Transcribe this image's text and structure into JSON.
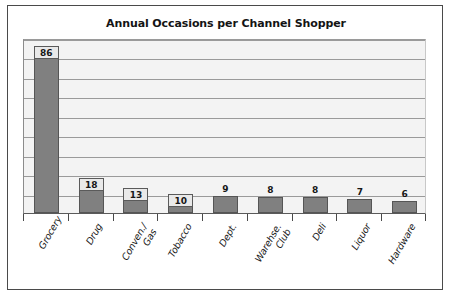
{
  "chart_data": {
    "type": "bar",
    "title": "Annual Occasions per Channel Shopper",
    "xlabel": "",
    "ylabel": "",
    "ylim": [
      0,
      90
    ],
    "ytick_step": 10,
    "grid": true,
    "legend": "none",
    "orientation": "vertical",
    "categories": [
      "Grocery",
      "Drug",
      "Conven./\nGas",
      "Tobacco",
      "Dept.",
      "Warehse.\nClub",
      "Deli",
      "Liquor",
      "Hardware"
    ],
    "values": [
      86,
      18,
      13,
      10,
      9,
      8,
      8,
      7,
      6
    ],
    "value_label_placement": [
      "inside",
      "inside",
      "inside",
      "inside",
      "above",
      "above",
      "above",
      "above",
      "above"
    ]
  },
  "style": {
    "bar_color": "#808080",
    "bar_border_color": "#555555",
    "plot_background": "#f3f3f3",
    "gridline_color": "#9a9a9a",
    "frame_color": "#4a4a4a",
    "text_color": "#141414"
  }
}
